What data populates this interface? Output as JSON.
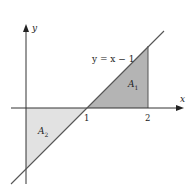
{
  "diagram": {
    "equation_label": "y = x − 1",
    "x_axis_label": "x",
    "y_axis_label": "y",
    "tick_labels": [
      "1",
      "2"
    ],
    "region_labels": {
      "A1": {
        "main": "A",
        "sub": "1"
      },
      "A2": {
        "main": "A",
        "sub": "2"
      }
    },
    "colors": {
      "A1_fill": "#b4b4b4",
      "A2_fill": "#e2e2e2",
      "axis": "#333333",
      "line": "#555555"
    }
  }
}
